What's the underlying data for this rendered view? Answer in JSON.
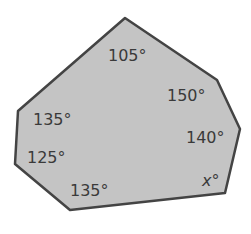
{
  "diagram": {
    "type": "polygon",
    "sides": 7,
    "fill": "#c4c4c4",
    "stroke": "#444444",
    "vertices": [
      [
        125,
        18
      ],
      [
        217,
        80
      ],
      [
        240,
        129
      ],
      [
        225,
        193
      ],
      [
        70,
        210
      ],
      [
        15,
        164
      ],
      [
        18,
        111
      ]
    ],
    "angles": [
      {
        "vertex": "top",
        "label": "105°",
        "x": 108,
        "y": 61
      },
      {
        "vertex": "upper-right",
        "label": "150°",
        "x": 167,
        "y": 101
      },
      {
        "vertex": "right",
        "label": "140°",
        "x": 186,
        "y": 143
      },
      {
        "vertex": "lower-right",
        "label": "x°",
        "x": 202,
        "y": 186
      },
      {
        "vertex": "bottom",
        "label": "135°",
        "x": 70,
        "y": 196
      },
      {
        "vertex": "lower-left",
        "label": "125°",
        "x": 27,
        "y": 163
      },
      {
        "vertex": "left",
        "label": "135°",
        "x": 33,
        "y": 125
      }
    ]
  }
}
